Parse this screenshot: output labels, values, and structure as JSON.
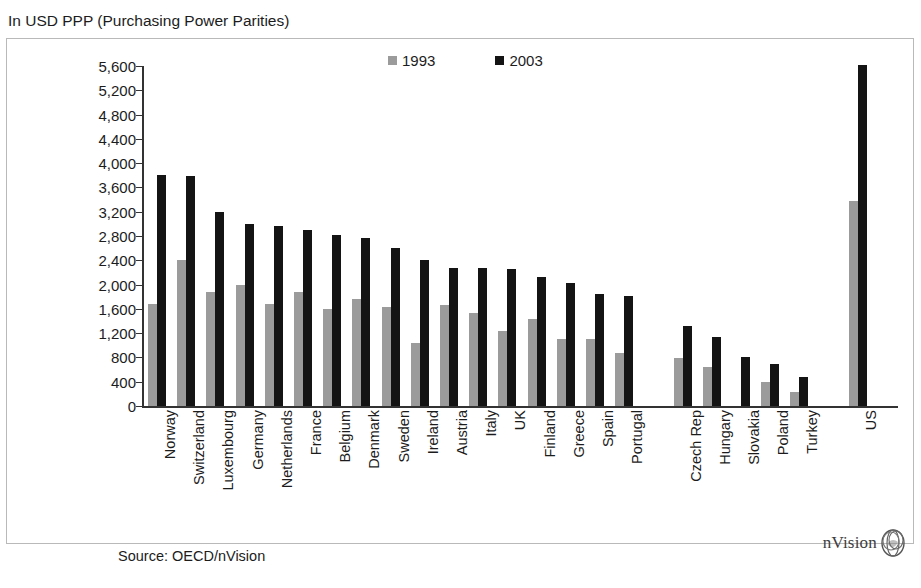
{
  "header": {
    "title": "In USD PPP (Purchasing Power Parities)"
  },
  "footer": {
    "source": "Source: OECD/nVision",
    "logo_text": "nVision",
    "logo_icon": "nvision-sphere-icon"
  },
  "legend": {
    "position": "top-center",
    "items": [
      {
        "label": "1993",
        "color": "#9b9b9b",
        "icon": "legend-swatch-1993"
      },
      {
        "label": "2003",
        "color": "#141414",
        "icon": "legend-swatch-2003"
      }
    ]
  },
  "chart_data": {
    "type": "bar",
    "title": "In USD PPP (Purchasing Power Parities)",
    "subtitle": "",
    "xlabel": "",
    "ylabel": "",
    "ylim": [
      0,
      5600
    ],
    "ytick_step": 400,
    "grid": false,
    "legend_position": "top-center",
    "source": "Source: OECD/nVision",
    "yticks": [
      "5,600",
      "5,200",
      "4,800",
      "4,400",
      "4,000",
      "3,600",
      "3,200",
      "2,800",
      "2,400",
      "2,000",
      "1,600",
      "1,200",
      "800",
      "400",
      "0"
    ],
    "ytick_values": [
      5600,
      5200,
      4800,
      4400,
      4000,
      3600,
      3200,
      2800,
      2400,
      2000,
      1600,
      1200,
      800,
      400,
      0
    ],
    "categories": [
      "Norway",
      "Switzerland",
      "Luxembourg",
      "Germany",
      "Netherlands",
      "France",
      "Belgium",
      "Denmark",
      "Sweden",
      "Ireland",
      "Austria",
      "Italy",
      "UK",
      "Finland",
      "Greece",
      "Spain",
      "Portugal",
      "GAP",
      "Czech Rep",
      "Hungary",
      "Slovakia",
      "Poland",
      "Turkey",
      "GAP2",
      "US"
    ],
    "series": [
      {
        "name": "1993",
        "color": "#9b9b9b",
        "values": [
          1680,
          2400,
          1880,
          1990,
          1680,
          1880,
          1590,
          1760,
          1630,
          1030,
          1670,
          1540,
          1230,
          1430,
          1100,
          1110,
          870,
          null,
          790,
          650,
          null,
          400,
          230,
          null,
          3380
        ]
      },
      {
        "name": "2003",
        "color": "#141414",
        "values": [
          3800,
          3790,
          3200,
          3000,
          2960,
          2900,
          2820,
          2770,
          2600,
          2400,
          2280,
          2270,
          2250,
          2130,
          2020,
          1850,
          1810,
          null,
          1320,
          1130,
          800,
          700,
          480,
          null,
          5620
        ]
      }
    ]
  }
}
